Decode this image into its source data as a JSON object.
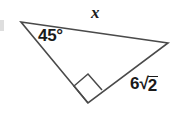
{
  "figure": {
    "kind": "geometry-diagram",
    "background_color": "#ffffff",
    "stroke_color": "#4a4a4a",
    "text_color": "#1a1a1a",
    "stroke_width": 1.6,
    "canvas": {
      "width": 184,
      "height": 119
    }
  },
  "triangle": {
    "vertices": [
      {
        "id": "top-left",
        "x": 21,
        "y": 22
      },
      {
        "id": "right",
        "x": 168,
        "y": 43
      },
      {
        "id": "bottom",
        "x": 88,
        "y": 103
      }
    ],
    "points_attr": "21,22 168,43 88,103"
  },
  "right_angle_marker": {
    "at_vertex": "bottom",
    "points_attr": "88,103 74,86 88,74 102,90",
    "size": 17
  },
  "labels": {
    "hypotenuse_unknown": "x",
    "angle": "45°",
    "angle_value": 45,
    "angle_unit": "degrees",
    "side_coefficient": "6",
    "side_radical_sign": "√",
    "side_radicand": "2",
    "side_full": "6√2"
  }
}
